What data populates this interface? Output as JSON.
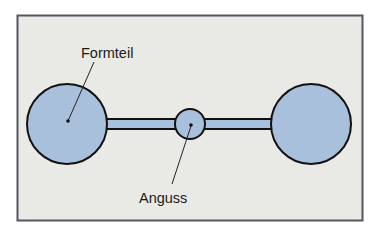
{
  "diagram": {
    "title": "",
    "labels": {
      "part": "Formteil",
      "sprue": "Anguss"
    },
    "elements": [
      {
        "id": "part-left",
        "kind": "molded-part",
        "shape": "circle"
      },
      {
        "id": "sprue",
        "kind": "sprue",
        "shape": "circle"
      },
      {
        "id": "part-right",
        "kind": "molded-part",
        "shape": "circle"
      },
      {
        "id": "runner-left",
        "kind": "runner",
        "shape": "bar"
      },
      {
        "id": "runner-right",
        "kind": "runner",
        "shape": "bar"
      }
    ],
    "colors": {
      "background": "#e9eae6",
      "frame": "#55555f",
      "fill": "#a9c0dc",
      "stroke": "#111111",
      "text": "#1a1a1a"
    }
  }
}
